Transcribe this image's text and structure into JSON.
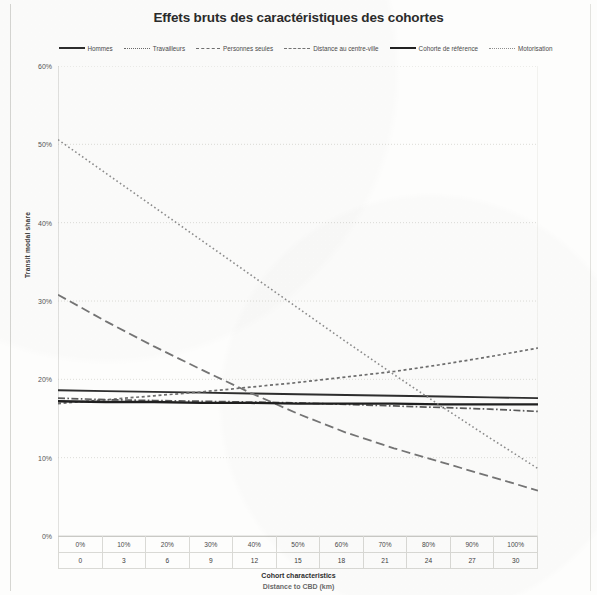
{
  "chart_data": {
    "type": "line",
    "title": "Effets bruts des caractéristiques des cohortes",
    "xlabel": "Cohort characteristics",
    "xlabel_secondary": "Distance to CBD (km)",
    "ylabel": "Transit modal share",
    "ylim": [
      0,
      60
    ],
    "y_ticks": [
      "0%",
      "10%",
      "20%",
      "30%",
      "40%",
      "50%",
      "60%"
    ],
    "y_tick_values": [
      0,
      10,
      20,
      30,
      40,
      50,
      60
    ],
    "x_ticks_percent": [
      "0%",
      "10%",
      "20%",
      "30%",
      "40%",
      "50%",
      "60%",
      "70%",
      "80%",
      "90%",
      "100%"
    ],
    "x_ticks_distance": [
      "0",
      "3",
      "6",
      "9",
      "12",
      "15",
      "18",
      "21",
      "24",
      "27",
      "30"
    ],
    "x_values": [
      0,
      10,
      20,
      30,
      40,
      50,
      60,
      70,
      80,
      90,
      100
    ],
    "grid": true,
    "legend_position": "top",
    "series": [
      {
        "name": "Hommes",
        "style": "solid",
        "color": "#2e2e2e",
        "width": 1.9,
        "values": [
          18.6,
          18.5,
          18.4,
          18.3,
          18.2,
          18.1,
          18.0,
          17.9,
          17.8,
          17.7,
          17.6
        ]
      },
      {
        "name": "Travailleurs",
        "style": "dotted-dash",
        "color": "#6e6e6e",
        "width": 1.7,
        "values": [
          16.9,
          17.4,
          17.9,
          18.4,
          19.0,
          19.6,
          20.3,
          21.0,
          21.9,
          22.9,
          24.0
        ]
      },
      {
        "name": "Personnes seules",
        "style": "dash-dot",
        "color": "#5a5a5a",
        "width": 1.7,
        "values": [
          17.6,
          17.4,
          17.3,
          17.2,
          17.1,
          17.0,
          16.8,
          16.6,
          16.4,
          16.2,
          15.9
        ]
      },
      {
        "name": "Distance au centre-ville",
        "style": "dashed-wide",
        "color": "#757575",
        "width": 1.8,
        "values": [
          30.8,
          27.4,
          24.2,
          21.2,
          18.3,
          15.6,
          13.2,
          11.2,
          9.4,
          7.6,
          5.8
        ]
      },
      {
        "name": "Cohorte de référence",
        "style": "solid-thick",
        "color": "#1f1f1f",
        "width": 2.4,
        "values": [
          17.2,
          17.1,
          17.1,
          17.0,
          17.0,
          16.9,
          16.9,
          16.9,
          16.8,
          16.8,
          16.8
        ]
      },
      {
        "name": "Motorisation",
        "style": "dotted-fine",
        "color": "#8d8d8d",
        "width": 1.6,
        "values": [
          50.6,
          46.3,
          42.0,
          37.7,
          33.4,
          29.1,
          24.8,
          20.6,
          16.5,
          12.5,
          8.6
        ]
      }
    ]
  }
}
